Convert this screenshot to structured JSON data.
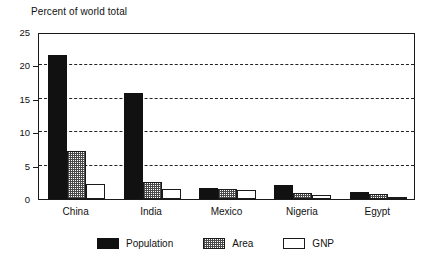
{
  "chart_data": {
    "type": "bar",
    "title": "Percent of world total",
    "xlabel": "",
    "ylabel": "",
    "ylim": [
      0,
      25
    ],
    "yticks": [
      0,
      5,
      10,
      15,
      20,
      25
    ],
    "grid": true,
    "legend_position": "bottom",
    "categories": [
      "China",
      "India",
      "Mexico",
      "Nigeria",
      "Egypt"
    ],
    "series": [
      {
        "name": "Population",
        "color": "#111111",
        "fill": "solid",
        "values": [
          21.5,
          15.9,
          1.7,
          2.1,
          1.1
        ]
      },
      {
        "name": "Area",
        "color": "#4a4a4a",
        "fill": "dotted",
        "values": [
          7.2,
          2.5,
          1.5,
          0.9,
          0.7
        ]
      },
      {
        "name": "GNP",
        "color": "#ffffff",
        "fill": "hollow",
        "values": [
          2.2,
          1.5,
          1.3,
          0.6,
          0.3
        ]
      }
    ]
  },
  "axis": {
    "tick_labels": [
      "0",
      "5",
      "10",
      "15",
      "20",
      "25"
    ]
  },
  "legend": {
    "entries": [
      {
        "label": "Population"
      },
      {
        "label": "Area"
      },
      {
        "label": "GNP"
      }
    ]
  }
}
